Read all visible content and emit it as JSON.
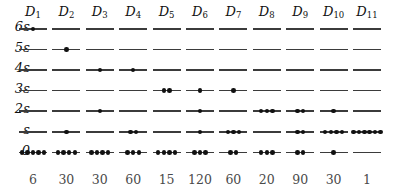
{
  "figure": {
    "type": "energy-level-microstate-diagram",
    "column_headers": [
      "D₁",
      "D₂",
      "D₃",
      "D₄",
      "D₅",
      "D₆",
      "D₇",
      "D₈",
      "D₉",
      "D₁₀",
      "D₁₁"
    ],
    "column_header_base": "D",
    "column_header_subs": [
      "1",
      "2",
      "3",
      "4",
      "5",
      "6",
      "7",
      "8",
      "9",
      "10",
      "11"
    ],
    "row_labels": [
      "6ε",
      "5ε",
      "4ε",
      "3ε",
      "2ε",
      "ε",
      "0"
    ],
    "row_energies": [
      6,
      5,
      4,
      3,
      2,
      1,
      0
    ],
    "multiplicity_row": [
      "6",
      "30",
      "30",
      "60",
      "15",
      "120",
      "60",
      "20",
      "90",
      "30",
      "1"
    ],
    "line_color": "#3b3b3b",
    "dot_color": "#111111",
    "text_color": "#111111",
    "multiplicity_color": "#4a4a4a",
    "background": "#ffffff"
  },
  "chart_data": {
    "type": "table",
    "title": "",
    "xlabel": "",
    "ylabel": "",
    "categories": [
      "D₁",
      "D₂",
      "D₃",
      "D₄",
      "D₅",
      "D₆",
      "D₇",
      "D₈",
      "D₉",
      "D₁₀",
      "D₁₁"
    ],
    "levels": [
      "6ε",
      "5ε",
      "4ε",
      "3ε",
      "2ε",
      "ε",
      "0"
    ],
    "occupancy": {
      "D₁": {
        "6ε": 1,
        "5ε": 0,
        "4ε": 0,
        "3ε": 0,
        "2ε": 0,
        "ε": 0,
        "0": 5
      },
      "D₂": {
        "6ε": 0,
        "5ε": 1,
        "4ε": 0,
        "3ε": 0,
        "2ε": 0,
        "ε": 1,
        "0": 4
      },
      "D₃": {
        "6ε": 0,
        "5ε": 0,
        "4ε": 1,
        "3ε": 0,
        "2ε": 1,
        "ε": 0,
        "0": 4
      },
      "D₄": {
        "6ε": 0,
        "5ε": 0,
        "4ε": 1,
        "3ε": 0,
        "2ε": 0,
        "ε": 2,
        "0": 3
      },
      "D₅": {
        "6ε": 0,
        "5ε": 0,
        "4ε": 0,
        "3ε": 2,
        "2ε": 0,
        "ε": 0,
        "0": 4
      },
      "D₆": {
        "6ε": 0,
        "5ε": 0,
        "4ε": 0,
        "3ε": 1,
        "2ε": 1,
        "ε": 1,
        "0": 3
      },
      "D₇": {
        "6ε": 0,
        "5ε": 0,
        "4ε": 0,
        "3ε": 1,
        "2ε": 0,
        "ε": 3,
        "0": 2
      },
      "D₈": {
        "6ε": 0,
        "5ε": 0,
        "4ε": 0,
        "3ε": 0,
        "2ε": 3,
        "ε": 0,
        "0": 3
      },
      "D₉": {
        "6ε": 0,
        "5ε": 0,
        "4ε": 0,
        "3ε": 0,
        "2ε": 2,
        "ε": 2,
        "0": 2
      },
      "D₁₀": {
        "6ε": 0,
        "5ε": 0,
        "4ε": 0,
        "3ε": 0,
        "2ε": 1,
        "ε": 4,
        "0": 1
      },
      "D₁₁": {
        "6ε": 0,
        "5ε": 0,
        "4ε": 0,
        "3ε": 0,
        "2ε": 0,
        "ε": 6,
        "0": 0
      }
    },
    "multiplicities": [
      6,
      30,
      30,
      60,
      15,
      120,
      60,
      20,
      90,
      30,
      1
    ],
    "grid": false,
    "legend": "none"
  },
  "layout": {
    "header_y": 4,
    "row_start_y": 28,
    "row_spacing": 20.6,
    "col_start_x": 33,
    "col_spacing": 33.4,
    "line_width": 28,
    "mult_y": 172
  }
}
